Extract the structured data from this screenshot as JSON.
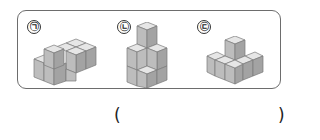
{
  "question": {
    "figures": [
      {
        "label": "㉠",
        "description": "isometric stack of cubes: 2x3 base layer with one cube on top at front-left"
      },
      {
        "label": "㉡",
        "description": "isometric stack of cubes: tower three high at back with lower steps"
      },
      {
        "label": "㉢",
        "description": "isometric stack of cubes: 3x3-ish base with one cube on top in center-back"
      }
    ],
    "answer_open": "(",
    "answer_close": ")"
  },
  "colors": {
    "cube_top": "#e6e6e6",
    "cube_left": "#bdbdbd",
    "cube_right": "#a3a3a3",
    "edge": "#7a7a7a",
    "frame": "#6d6d6d"
  }
}
